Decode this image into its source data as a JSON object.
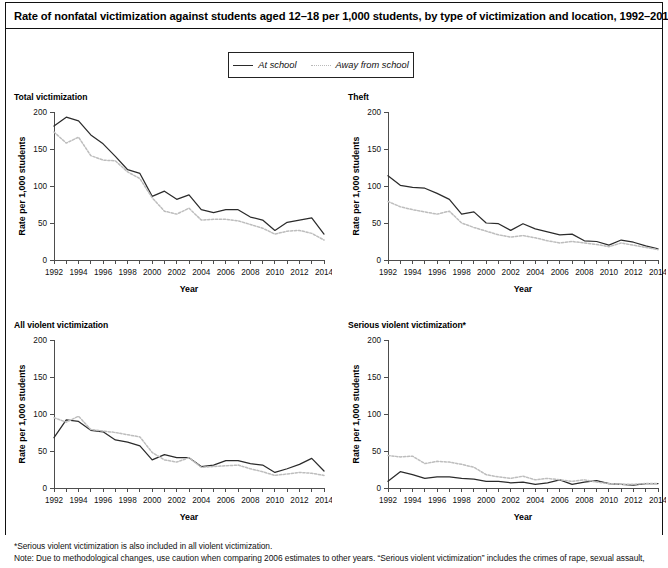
{
  "figure": {
    "title": "Rate of nonfatal victimization against students aged 12–18 per 1,000 students, by type of victimization and location, 1992–2014",
    "legend": {
      "items": [
        {
          "label": "At school",
          "style": "solid",
          "color": "#2b2b2b"
        },
        {
          "label": "Away from school",
          "style": "dotted",
          "color": "#bdbdbd"
        }
      ]
    },
    "notes": [
      "*Serious violent victimization is also included in all violent victimization.",
      "Note: Due to methodological changes, use caution when comparing 2006 estimates to other years. “Serious violent victimization” includes the crimes of rape, sexual assault,"
    ]
  },
  "chart_data": [
    {
      "type": "line",
      "title": "Total victimization",
      "xlabel": "Year",
      "ylabel": "Rate per 1,000 students",
      "ylim": [
        0,
        200
      ],
      "yticks": [
        0,
        50,
        100,
        150,
        200
      ],
      "xlim": [
        1992,
        2014
      ],
      "xticks": [
        1992,
        1994,
        1996,
        1998,
        2000,
        2002,
        2004,
        2006,
        2008,
        2010,
        2012,
        2014
      ],
      "grid": false,
      "legend_position": "top-center-shared",
      "x": [
        1992,
        1993,
        1994,
        1995,
        1996,
        1997,
        1998,
        1999,
        2000,
        2001,
        2002,
        2003,
        2004,
        2005,
        2006,
        2007,
        2008,
        2009,
        2010,
        2011,
        2012,
        2013,
        2014
      ],
      "series": [
        {
          "name": "At school",
          "values": [
            181,
            193,
            188,
            169,
            157,
            140,
            122,
            117,
            86,
            93,
            82,
            88,
            68,
            64,
            68,
            68,
            58,
            54,
            40,
            51,
            54,
            57,
            35
          ]
        },
        {
          "name": "Away from school",
          "values": [
            173,
            158,
            166,
            141,
            135,
            134,
            119,
            110,
            84,
            66,
            62,
            70,
            54,
            55,
            55,
            53,
            48,
            43,
            35,
            39,
            40,
            36,
            27
          ]
        }
      ]
    },
    {
      "type": "line",
      "title": "Theft",
      "xlabel": "Year",
      "ylabel": "Rate per 1,000 students",
      "ylim": [
        0,
        200
      ],
      "yticks": [
        0,
        50,
        100,
        150,
        200
      ],
      "xlim": [
        1992,
        2014
      ],
      "xticks": [
        1992,
        1994,
        1996,
        1998,
        2000,
        2002,
        2004,
        2006,
        2008,
        2010,
        2012,
        2014
      ],
      "grid": false,
      "legend_position": "top-center-shared",
      "x": [
        1992,
        1993,
        1994,
        1995,
        1996,
        1997,
        1998,
        1999,
        2000,
        2001,
        2002,
        2003,
        2004,
        2005,
        2006,
        2007,
        2008,
        2009,
        2010,
        2011,
        2012,
        2013,
        2014
      ],
      "series": [
        {
          "name": "At school",
          "values": [
            114,
            101,
            98,
            97,
            90,
            82,
            62,
            65,
            50,
            49,
            40,
            49,
            42,
            38,
            34,
            35,
            26,
            25,
            20,
            27,
            24,
            19,
            15
          ]
        },
        {
          "name": "Away from school",
          "values": [
            79,
            72,
            68,
            65,
            62,
            66,
            50,
            44,
            39,
            34,
            31,
            33,
            30,
            26,
            23,
            25,
            23,
            21,
            18,
            23,
            20,
            17,
            14
          ]
        }
      ]
    },
    {
      "type": "line",
      "title": "All violent victimization",
      "xlabel": "Year",
      "ylabel": "Rate per 1,000 students",
      "ylim": [
        0,
        200
      ],
      "yticks": [
        0,
        50,
        100,
        150,
        200
      ],
      "xlim": [
        1992,
        2014
      ],
      "xticks": [
        1992,
        1994,
        1996,
        1998,
        2000,
        2002,
        2004,
        2006,
        2008,
        2010,
        2012,
        2014
      ],
      "grid": false,
      "legend_position": "top-center-shared",
      "x": [
        1992,
        1993,
        1994,
        1995,
        1996,
        1997,
        1998,
        1999,
        2000,
        2001,
        2002,
        2003,
        2004,
        2005,
        2006,
        2007,
        2008,
        2009,
        2010,
        2011,
        2012,
        2013,
        2014
      ],
      "series": [
        {
          "name": "At school",
          "values": [
            68,
            92,
            90,
            78,
            76,
            65,
            62,
            57,
            38,
            45,
            41,
            41,
            29,
            31,
            37,
            37,
            33,
            31,
            21,
            26,
            32,
            40,
            23
          ]
        },
        {
          "name": "Away from school",
          "values": [
            95,
            89,
            97,
            79,
            77,
            75,
            72,
            69,
            48,
            38,
            35,
            41,
            28,
            29,
            30,
            31,
            26,
            22,
            17,
            19,
            21,
            20,
            17
          ]
        }
      ]
    },
    {
      "type": "line",
      "title": "Serious violent victimization*",
      "xlabel": "Year",
      "ylabel": "Rate per 1,000 students",
      "ylim": [
        0,
        200
      ],
      "yticks": [
        0,
        50,
        100,
        150,
        200
      ],
      "xlim": [
        1992,
        2014
      ],
      "xticks": [
        1992,
        1994,
        1996,
        1998,
        2000,
        2002,
        2004,
        2006,
        2008,
        2010,
        2012,
        2014
      ],
      "grid": false,
      "legend_position": "top-center-shared",
      "x": [
        1992,
        1993,
        1994,
        1995,
        1996,
        1997,
        1998,
        1999,
        2000,
        2001,
        2002,
        2003,
        2004,
        2005,
        2006,
        2007,
        2008,
        2009,
        2010,
        2011,
        2012,
        2013,
        2014
      ],
      "series": [
        {
          "name": "At school",
          "values": [
            9,
            22,
            18,
            13,
            15,
            15,
            13,
            12,
            9,
            9,
            7,
            8,
            5,
            7,
            11,
            5,
            8,
            10,
            6,
            5,
            4,
            6,
            6
          ]
        },
        {
          "name": "Away from school",
          "values": [
            44,
            42,
            43,
            33,
            36,
            35,
            32,
            28,
            18,
            15,
            13,
            16,
            11,
            13,
            11,
            9,
            11,
            8,
            6,
            5,
            5,
            6,
            6
          ]
        }
      ]
    }
  ]
}
